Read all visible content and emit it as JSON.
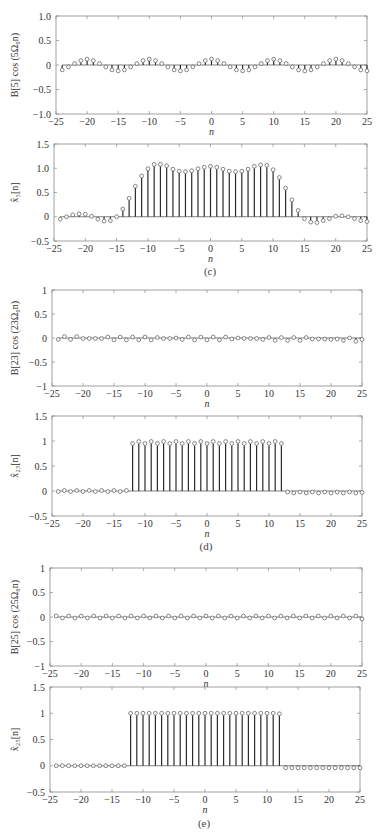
{
  "chart_data": [
    {
      "id": "c-top",
      "type": "stem",
      "ylabel": "B[5] cos (5Ω₀n)",
      "xlabel": "n",
      "xlim": [
        -25,
        25
      ],
      "ylim": [
        -1.0,
        1.0
      ],
      "xticks": [
        -25,
        -20,
        -15,
        -10,
        -5,
        0,
        5,
        10,
        15,
        20,
        25
      ],
      "yticks": [
        -1.0,
        -0.5,
        0,
        0.5,
        1.0
      ],
      "ytick_labels": [
        "−1.0",
        "−0.5",
        "0",
        "0.5",
        "1.0"
      ],
      "box": {
        "left": 56,
        "top": 16,
        "right": 367,
        "bottom": 114
      },
      "x": [
        -24,
        -23,
        -22,
        -21,
        -20,
        -19,
        -18,
        -17,
        -16,
        -15,
        -14,
        -13,
        -12,
        -11,
        -10,
        -9,
        -8,
        -7,
        -6,
        -5,
        -4,
        -3,
        -2,
        -1,
        0,
        1,
        2,
        3,
        4,
        5,
        6,
        7,
        8,
        9,
        10,
        11,
        12,
        13,
        14,
        15,
        16,
        17,
        18,
        19,
        20,
        21,
        22,
        23,
        24,
        25
      ],
      "values": [
        -0.1,
        -0.04,
        0.03,
        0.09,
        0.12,
        0.09,
        0.03,
        -0.04,
        -0.1,
        -0.12,
        -0.1,
        -0.04,
        0.03,
        0.09,
        0.12,
        0.09,
        0.03,
        -0.04,
        -0.1,
        -0.12,
        -0.1,
        -0.04,
        0.03,
        0.09,
        0.12,
        0.09,
        0.03,
        -0.04,
        -0.1,
        -0.12,
        -0.1,
        -0.04,
        0.03,
        0.09,
        0.12,
        0.09,
        0.03,
        -0.04,
        -0.1,
        -0.12,
        -0.1,
        -0.04,
        0.03,
        0.09,
        0.12,
        0.09,
        0.03,
        -0.04,
        -0.1,
        -0.12
      ]
    },
    {
      "id": "c-bottom",
      "type": "stem",
      "ylabel": "x̂₅[n]",
      "xlabel": "n",
      "caption": "(c)",
      "xlim": [
        -25,
        25
      ],
      "ylim": [
        -0.5,
        1.5
      ],
      "xticks": [
        -25,
        -20,
        -15,
        -10,
        -5,
        0,
        5,
        10,
        15,
        20,
        25
      ],
      "yticks": [
        -0.5,
        0,
        0.5,
        1.0,
        1.5
      ],
      "ytick_labels": [
        "−0.5",
        "0",
        "0.5",
        "1.0",
        "1.5"
      ],
      "box": {
        "left": 54,
        "top": 144,
        "right": 367,
        "bottom": 241
      },
      "x": [
        -24,
        -23,
        -22,
        -21,
        -20,
        -19,
        -18,
        -17,
        -16,
        -15,
        -14,
        -13,
        -12,
        -11,
        -10,
        -9,
        -8,
        -7,
        -6,
        -5,
        -4,
        -3,
        -2,
        -1,
        0,
        1,
        2,
        3,
        4,
        5,
        6,
        7,
        8,
        9,
        10,
        11,
        12,
        13,
        14,
        15,
        16,
        17,
        18,
        19,
        20,
        21,
        22,
        23,
        24,
        25
      ],
      "values": [
        -0.05,
        0.0,
        0.04,
        0.06,
        0.05,
        0.01,
        -0.05,
        -0.09,
        -0.08,
        0.0,
        0.16,
        0.38,
        0.63,
        0.84,
        0.99,
        1.08,
        1.08,
        1.05,
        0.98,
        0.94,
        0.93,
        0.95,
        0.99,
        1.02,
        1.04,
        1.02,
        0.98,
        0.94,
        0.93,
        0.94,
        0.98,
        1.04,
        1.07,
        1.06,
        0.97,
        0.81,
        0.59,
        0.35,
        0.13,
        -0.04,
        -0.11,
        -0.12,
        -0.08,
        -0.04,
        0.01,
        0.02,
        0.0,
        -0.04,
        -0.08,
        -0.1
      ]
    },
    {
      "id": "d-top",
      "type": "stem",
      "ylabel": "B[23] cos (23Ω₀n)",
      "xlabel": "n",
      "xlim": [
        -25,
        25
      ],
      "ylim": [
        -1,
        1
      ],
      "xticks": [
        -25,
        -20,
        -15,
        -10,
        -5,
        0,
        5,
        10,
        15,
        20,
        25
      ],
      "yticks": [
        -1,
        -0.5,
        0,
        0.5,
        1
      ],
      "ytick_labels": [
        "−1",
        "−0.5",
        "0",
        "0.5",
        "1"
      ],
      "box": {
        "left": 52,
        "top": 290,
        "right": 362,
        "bottom": 386
      },
      "x": [
        -24,
        -23,
        -22,
        -21,
        -20,
        -19,
        -18,
        -17,
        -16,
        -15,
        -14,
        -13,
        -12,
        -11,
        -10,
        -9,
        -8,
        -7,
        -6,
        -5,
        -4,
        -3,
        -2,
        -1,
        0,
        1,
        2,
        3,
        4,
        5,
        6,
        7,
        8,
        9,
        10,
        11,
        12,
        13,
        14,
        15,
        16,
        17,
        18,
        19,
        20,
        21,
        22,
        23,
        24,
        25
      ],
      "values": [
        -0.03,
        0.03,
        -0.03,
        0.03,
        -0.01,
        -0.01,
        -0.01,
        -0.01,
        0.02,
        -0.04,
        0.02,
        -0.04,
        0.02,
        -0.04,
        0.02,
        -0.04,
        0.01,
        -0.01,
        -0.01,
        0.0,
        -0.03,
        0.02,
        -0.04,
        0.02,
        -0.04,
        0.02,
        -0.04,
        0.02,
        -0.02,
        0.0,
        -0.01,
        -0.01,
        -0.01,
        -0.03,
        0.01,
        -0.05,
        0.01,
        -0.05,
        0.01,
        -0.05,
        0.01,
        -0.02,
        -0.02,
        -0.02,
        -0.03,
        -0.02,
        -0.05,
        0.0,
        -0.07,
        -0.03
      ]
    },
    {
      "id": "d-bottom",
      "type": "stem",
      "ylabel": "x̂₂₃[n]",
      "xlabel": "n",
      "caption": "(d)",
      "xlim": [
        -25,
        25
      ],
      "ylim": [
        -0.5,
        1.5
      ],
      "xticks": [
        -25,
        -20,
        -15,
        -10,
        -5,
        0,
        5,
        10,
        15,
        20,
        25
      ],
      "yticks": [
        -0.5,
        0,
        0.5,
        1,
        1.5
      ],
      "ytick_labels": [
        "−0.5",
        "0",
        "0.5",
        "1",
        "1.5"
      ],
      "box": {
        "left": 52,
        "top": 416,
        "right": 362,
        "bottom": 516
      },
      "x": [
        -24,
        -23,
        -22,
        -21,
        -20,
        -19,
        -18,
        -17,
        -16,
        -15,
        -14,
        -13,
        -12,
        -11,
        -10,
        -9,
        -8,
        -7,
        -6,
        -5,
        -4,
        -3,
        -2,
        -1,
        0,
        1,
        2,
        3,
        4,
        5,
        6,
        7,
        8,
        9,
        10,
        11,
        12,
        13,
        14,
        15,
        16,
        17,
        18,
        19,
        20,
        21,
        22,
        23,
        24,
        25
      ],
      "values": [
        -0.01,
        0.01,
        -0.01,
        0.01,
        -0.01,
        0.01,
        -0.01,
        0.01,
        -0.01,
        0.01,
        -0.01,
        0.01,
        0.95,
        0.99,
        0.95,
        0.99,
        0.95,
        0.99,
        0.95,
        0.99,
        0.95,
        0.99,
        0.95,
        0.99,
        0.95,
        0.99,
        0.95,
        0.99,
        0.95,
        0.99,
        0.95,
        0.99,
        0.95,
        0.99,
        0.95,
        0.99,
        0.95,
        -0.02,
        -0.04,
        -0.02,
        -0.04,
        -0.02,
        -0.04,
        -0.02,
        -0.04,
        -0.02,
        -0.04,
        -0.02,
        -0.04,
        -0.03
      ]
    },
    {
      "id": "e-top",
      "type": "stem",
      "ylabel": "B[25] cos (25Ω₀n)",
      "xlabel": "n",
      "xlim": [
        -25,
        25
      ],
      "ylim": [
        -1,
        1
      ],
      "xticks": [
        -25,
        -20,
        -15,
        -10,
        -5,
        0,
        5,
        10,
        15,
        20,
        25
      ],
      "yticks": [
        -1,
        -0.5,
        0,
        0.5,
        1
      ],
      "ytick_labels": [
        "−1",
        "−0.5",
        "0",
        "0.5",
        "1"
      ],
      "box": {
        "left": 50,
        "top": 568,
        "right": 362,
        "bottom": 666
      },
      "x": [
        -24,
        -23,
        -22,
        -21,
        -20,
        -19,
        -18,
        -17,
        -16,
        -15,
        -14,
        -13,
        -12,
        -11,
        -10,
        -9,
        -8,
        -7,
        -6,
        -5,
        -4,
        -3,
        -2,
        -1,
        0,
        1,
        2,
        3,
        4,
        5,
        6,
        7,
        8,
        9,
        10,
        11,
        12,
        13,
        14,
        15,
        16,
        17,
        18,
        19,
        20,
        21,
        22,
        23,
        24,
        25
      ],
      "values": [
        0.02,
        -0.02,
        0.02,
        -0.02,
        0.02,
        -0.02,
        0.02,
        -0.02,
        0.02,
        -0.02,
        0.02,
        -0.02,
        0.02,
        -0.02,
        0.02,
        -0.02,
        0.02,
        -0.02,
        0.02,
        -0.02,
        0.02,
        -0.02,
        0.02,
        -0.02,
        0.02,
        -0.02,
        0.02,
        -0.02,
        0.02,
        -0.02,
        0.02,
        -0.02,
        0.02,
        -0.02,
        0.02,
        -0.02,
        0.02,
        -0.02,
        0.02,
        -0.02,
        0.02,
        -0.02,
        0.02,
        -0.02,
        0.02,
        -0.02,
        0.02,
        -0.02,
        0.02,
        -0.04
      ]
    },
    {
      "id": "e-bottom",
      "type": "stem",
      "ylabel": "x̂₂₅[n]",
      "xlabel": "n",
      "caption": "(e)",
      "xlim": [
        -25,
        25
      ],
      "ylim": [
        -0.5,
        1.5
      ],
      "xticks": [
        -25,
        -20,
        -15,
        -10,
        -5,
        0,
        5,
        10,
        15,
        20,
        25
      ],
      "yticks": [
        -0.5,
        0,
        0.5,
        1,
        1.5
      ],
      "ytick_labels": [
        "−0.5",
        "0",
        "0.5",
        "1",
        "1.5"
      ],
      "box": {
        "left": 50,
        "top": 687,
        "right": 360,
        "bottom": 792
      },
      "x": [
        -24,
        -23,
        -22,
        -21,
        -20,
        -19,
        -18,
        -17,
        -16,
        -15,
        -14,
        -13,
        -12,
        -11,
        -10,
        -9,
        -8,
        -7,
        -6,
        -5,
        -4,
        -3,
        -2,
        -1,
        0,
        1,
        2,
        3,
        4,
        5,
        6,
        7,
        8,
        9,
        10,
        11,
        12,
        13,
        14,
        15,
        16,
        17,
        18,
        19,
        20,
        21,
        22,
        23,
        24,
        25
      ],
      "values": [
        0.0,
        0.0,
        0.0,
        0.0,
        0.0,
        0.0,
        0.0,
        0.0,
        0.0,
        0.0,
        0.0,
        0.0,
        1.0,
        1.0,
        1.0,
        1.0,
        1.0,
        1.0,
        1.0,
        1.0,
        1.0,
        1.0,
        1.0,
        1.0,
        1.0,
        1.0,
        1.0,
        1.0,
        1.0,
        1.0,
        1.0,
        1.0,
        1.0,
        1.0,
        1.0,
        1.0,
        0.99,
        -0.04,
        -0.04,
        -0.04,
        -0.04,
        -0.04,
        -0.04,
        -0.04,
        -0.04,
        -0.04,
        -0.04,
        -0.04,
        -0.04,
        -0.04
      ]
    }
  ],
  "captions": {
    "c": "(c)",
    "d": "(d)",
    "e": "(e)"
  },
  "colors": {
    "axis": "#8a8a8a",
    "stem": "#2a2a2a",
    "marker": "#555555",
    "text": "#333333"
  }
}
